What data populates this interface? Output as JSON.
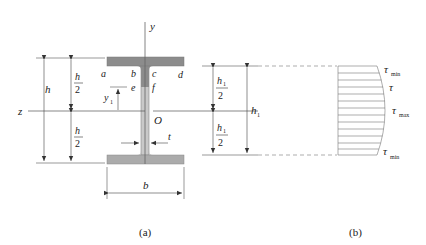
{
  "figure_a": {
    "caption": "(a)",
    "axes": {
      "y": "y",
      "z": "z",
      "origin": "O"
    },
    "points": {
      "a": "a",
      "b": "b",
      "c": "c",
      "d": "d",
      "e": "e",
      "f": "f"
    },
    "dimensions": {
      "height": "h",
      "half_height_num": "h",
      "half_height_den": "2",
      "y1_main": "y",
      "y1_sub": "1",
      "web_thickness": "t",
      "flange_width": "b"
    },
    "colors": {
      "flange": "#8c8c8c",
      "web": "#c8c8c8",
      "web_shaded": "#8c8c8c"
    }
  },
  "figure_b": {
    "caption": "(b)",
    "dimensions": {
      "h1_main": "h",
      "h1_sub": "1",
      "half_h1_den": "2"
    },
    "stress_labels": {
      "top": {
        "main": "τ",
        "sub": "min"
      },
      "mid_upper": {
        "main": "τ",
        "sub": ""
      },
      "max": {
        "main": "τ",
        "sub": "max"
      },
      "bottom": {
        "main": "τ",
        "sub": "min"
      }
    }
  }
}
